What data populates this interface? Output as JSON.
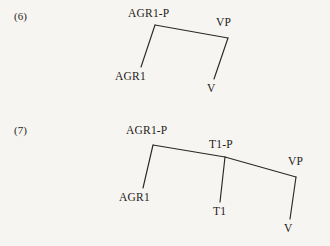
{
  "page": {
    "background_color": "#f7f5f1",
    "text_color": "#1d1b19",
    "line_color": "#2b2724",
    "content_type": "linguistic-syntax-tree-examples"
  },
  "examples": [
    {
      "number": "(6)",
      "number_x": 14,
      "number_y": 10,
      "nodes": [
        {
          "id": "agr1p",
          "label": "AGR1-P",
          "label_x": 128,
          "label_y": 7,
          "point_x": 155,
          "point_y": 25
        },
        {
          "id": "agr1",
          "label": "AGR1",
          "label_x": 115,
          "label_y": 70,
          "point_x": 141,
          "point_y": 67
        },
        {
          "id": "vp",
          "label": "VP",
          "label_x": 216,
          "label_y": 16,
          "point_x": 228,
          "point_y": 38
        },
        {
          "id": "v",
          "label": "V",
          "label_x": 207,
          "label_y": 82,
          "point_x": 214,
          "point_y": 79
        }
      ],
      "edges": [
        {
          "from": "agr1p",
          "to": "agr1"
        },
        {
          "from": "agr1p",
          "to": "vp"
        },
        {
          "from": "vp",
          "to": "v"
        }
      ]
    },
    {
      "number": "(7)",
      "number_x": 14,
      "number_y": 124,
      "nodes": [
        {
          "id": "agr1p",
          "label": "AGR1-P",
          "label_x": 126,
          "label_y": 124,
          "point_x": 153,
          "point_y": 145
        },
        {
          "id": "agr1",
          "label": "AGR1",
          "label_x": 119,
          "label_y": 191,
          "point_x": 143,
          "point_y": 188
        },
        {
          "id": "t1p",
          "label": "T1-P",
          "label_x": 209,
          "label_y": 138,
          "point_x": 225,
          "point_y": 157
        },
        {
          "id": "t1",
          "label": "T1",
          "label_x": 213,
          "label_y": 205,
          "point_x": 220,
          "point_y": 202
        },
        {
          "id": "vp",
          "label": "VP",
          "label_x": 288,
          "label_y": 155,
          "point_x": 296,
          "point_y": 177
        },
        {
          "id": "v",
          "label": "V",
          "label_x": 284,
          "label_y": 222,
          "point_x": 290,
          "point_y": 219
        }
      ],
      "edges": [
        {
          "from": "agr1p",
          "to": "agr1"
        },
        {
          "from": "agr1p",
          "to": "t1p"
        },
        {
          "from": "t1p",
          "to": "t1"
        },
        {
          "from": "t1p",
          "to": "vp"
        },
        {
          "from": "vp",
          "to": "v"
        }
      ]
    }
  ]
}
